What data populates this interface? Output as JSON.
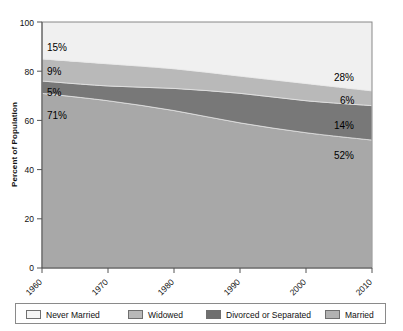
{
  "chart_data": {
    "type": "area",
    "title": "",
    "subtitle": "",
    "xlabel": "",
    "ylabel": "Percent of Population",
    "stacked": true,
    "stack_order_bottom_to_top": [
      "Married",
      "Divorced or Separated",
      "Widowed",
      "Never Married"
    ],
    "grid": false,
    "legend_position": "bottom",
    "xlim": [
      1960,
      2010
    ],
    "ylim": [
      0,
      100
    ],
    "x": [
      1960,
      1970,
      1980,
      1990,
      2000,
      2010
    ],
    "xtick_labels": [
      "1960",
      "1970",
      "1980",
      "1990",
      "2000",
      "2010"
    ],
    "ytick_labels": [
      "0",
      "20",
      "40",
      "60",
      "80",
      "100"
    ],
    "ytick_values": [
      0,
      20,
      40,
      60,
      80,
      100
    ],
    "series": [
      {
        "name": "Married",
        "color": "#a8a8a8",
        "values": [
          71,
          68,
          64,
          59,
          55,
          52
        ]
      },
      {
        "name": "Divorced or Separated",
        "color": "#787878",
        "values": [
          5,
          6,
          9,
          12,
          13,
          14
        ]
      },
      {
        "name": "Widowed",
        "color": "#b9b9b9",
        "values": [
          9,
          9,
          8,
          7,
          7,
          6
        ]
      },
      {
        "name": "Never Married",
        "color": "#f0f0f0",
        "values": [
          15,
          17,
          19,
          22,
          25,
          28
        ]
      }
    ],
    "annotations": {
      "left": [
        {
          "label": "15%",
          "series": "Never Married",
          "value": 15
        },
        {
          "label": "9%",
          "series": "Widowed",
          "value": 9
        },
        {
          "label": "5%",
          "series": "Divorced or Separated",
          "value": 5
        },
        {
          "label": "71%",
          "series": "Married",
          "value": 71
        }
      ],
      "right": [
        {
          "label": "28%",
          "series": "Never Married",
          "value": 28
        },
        {
          "label": "6%",
          "series": "Widowed",
          "value": 6
        },
        {
          "label": "14%",
          "series": "Divorced or Separated",
          "value": 14
        },
        {
          "label": "52%",
          "series": "Married",
          "value": 52
        }
      ]
    }
  },
  "legend": {
    "items": [
      {
        "label": "Never Married",
        "color": "#f4f4f4"
      },
      {
        "label": "Widowed",
        "color": "#b9b9b9"
      },
      {
        "label": "Divorced or Separated",
        "color": "#6f6f6f"
      },
      {
        "label": "Married",
        "color": "#b2b2b2"
      }
    ]
  },
  "axes": {
    "y_title": "Percent of Population",
    "y_ticks": [
      "100",
      "80",
      "60",
      "40",
      "20",
      "0"
    ],
    "x_ticks": [
      "1960",
      "1970",
      "1980",
      "1990",
      "2000",
      "2010"
    ]
  },
  "labels": {
    "left_never_married": "15%",
    "left_widowed": "9%",
    "left_divorced": "5%",
    "left_married": "71%",
    "right_never_married": "28%",
    "right_widowed": "6%",
    "right_divorced": "14%",
    "right_married": "52%"
  },
  "colors": {
    "never_married": "#f0f0f0",
    "widowed": "#b9b9b9",
    "divorced": "#787878",
    "married": "#a8a8a8",
    "axis": "#555555",
    "plot_border": "#8a8a8a"
  }
}
